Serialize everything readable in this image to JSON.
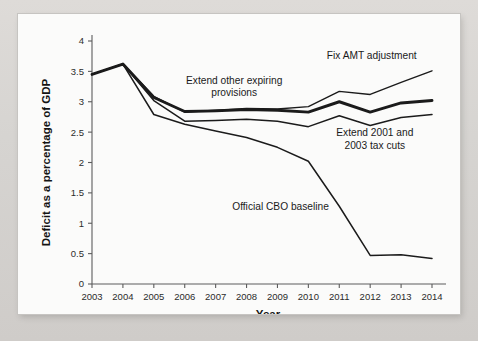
{
  "figure": {
    "background_color": "#d9d9d7",
    "paper_color": "#fbfbfa",
    "line_color": "#1b1b1b",
    "axis_color": "#5c5c5c"
  },
  "chart_data": {
    "type": "line",
    "title": "",
    "xlabel": "Year",
    "ylabel": "Deficit as a percentage of GDP",
    "x": [
      2003,
      2004,
      2005,
      2006,
      2007,
      2008,
      2009,
      2010,
      2011,
      2012,
      2013,
      2014
    ],
    "xtick_labels": [
      "2003",
      "2004",
      "2005",
      "2006",
      "2007",
      "2008",
      "2009",
      "2010",
      "2011",
      "2012",
      "2013",
      "2014"
    ],
    "ytick_labels": [
      "0",
      "0.5",
      "1",
      "1.5",
      "2",
      "2.5",
      "3",
      "3.5",
      "4"
    ],
    "ytick_values": [
      0,
      0.5,
      1,
      1.5,
      2,
      2.5,
      3,
      3.5,
      4
    ],
    "xlim": [
      2003,
      2014
    ],
    "ylim": [
      0,
      4
    ],
    "grid": false,
    "legend": "in-plot annotations",
    "series": [
      {
        "name": "Fix AMT adjustment",
        "weight": "thin",
        "values": [
          3.45,
          3.62,
          3.09,
          2.83,
          2.86,
          2.89,
          2.88,
          2.92,
          3.17,
          3.12,
          3.32,
          3.51
        ]
      },
      {
        "name": "Extend other expiring provisions",
        "weight": "thick",
        "values": [
          3.45,
          3.62,
          3.07,
          2.84,
          2.85,
          2.87,
          2.86,
          2.83,
          3.0,
          2.83,
          2.98,
          3.02
        ]
      },
      {
        "name": "Extend 2001 and 2003 tax cuts",
        "weight": "med",
        "values": [
          3.45,
          3.62,
          3.02,
          2.68,
          2.69,
          2.71,
          2.68,
          2.59,
          2.77,
          2.61,
          2.74,
          2.79
        ]
      },
      {
        "name": "Official CBO baseline",
        "weight": "med",
        "values": [
          3.45,
          3.62,
          2.79,
          2.63,
          2.52,
          2.41,
          2.25,
          2.02,
          1.28,
          0.47,
          0.48,
          0.42
        ]
      }
    ],
    "annotations": [
      {
        "text": "Fix AMT adjustment",
        "x": 2012.05,
        "y": 3.7,
        "lines": [
          "Fix AMT adjustment"
        ]
      },
      {
        "text": "Extend other expiring provisions",
        "x": 2007.6,
        "y": 3.3,
        "lines": [
          "Extend other expiring",
          "provisions"
        ]
      },
      {
        "text": "Extend 2001 and 2003 tax cuts",
        "x": 2012.15,
        "y": 2.43,
        "lines": [
          "Extend 2001 and",
          "2003 tax cuts"
        ]
      },
      {
        "text": "Official CBO baseline",
        "x": 2009.1,
        "y": 1.22,
        "lines": [
          "Official CBO baseline"
        ]
      }
    ]
  }
}
